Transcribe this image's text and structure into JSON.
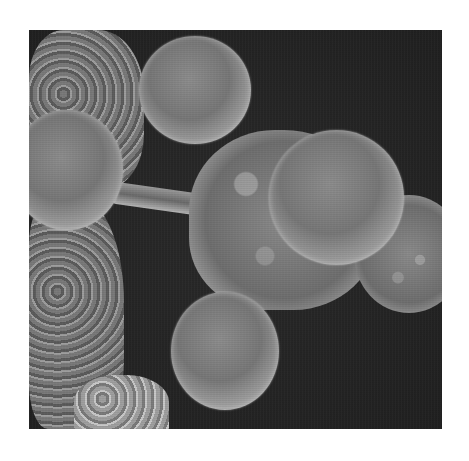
{
  "image": {
    "type": "scanning-electron-micrograph",
    "description": "Grayscale SEM image of several spherical cells clustered on rough tissue against a dark background",
    "colors": {
      "background": "#232323",
      "cell_mid": "#7a7a7a",
      "cell_highlight": "#d8d8d8",
      "page": "#ffffff"
    },
    "objects": [
      {
        "name": "top-left-tissue-mass"
      },
      {
        "name": "top-center-sphere-cell"
      },
      {
        "name": "left-sphere-cell"
      },
      {
        "name": "central-rough-cell-cluster"
      },
      {
        "name": "center-right-sphere-cell"
      },
      {
        "name": "right-partial-sphere-cell"
      },
      {
        "name": "bottom-center-sphere-cell"
      },
      {
        "name": "left-lower-tissue-mass"
      },
      {
        "name": "bottom-left-tissue-fragment"
      },
      {
        "name": "connecting-strand"
      }
    ]
  }
}
